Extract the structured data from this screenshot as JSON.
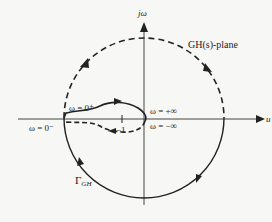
{
  "diagram": {
    "plane_label": "GH(s)-plane",
    "axes": {
      "vertical_label": "jω",
      "horizontal_label": "u"
    },
    "labels": {
      "omega_0_plus": "ω = 0⁺",
      "omega_0_minus": "ω = 0⁻",
      "omega_plus_inf": "ω = +∞",
      "omega_minus_inf": "ω = −∞",
      "minus_one": "−1",
      "contour_name": "Γ",
      "contour_subscript": "GH"
    },
    "colors": {
      "line": "#222222",
      "background": "#f7f7f5"
    }
  }
}
